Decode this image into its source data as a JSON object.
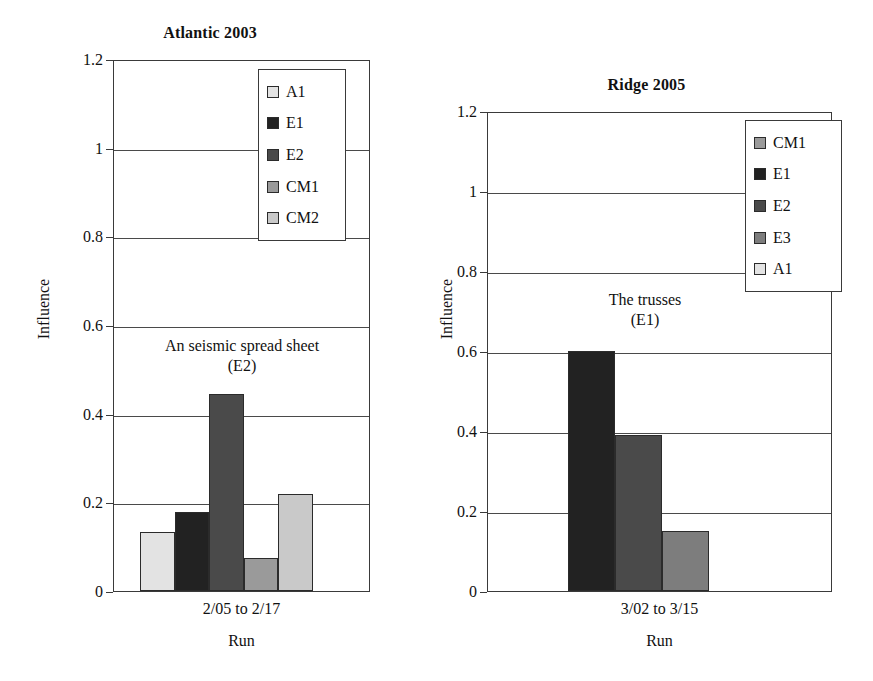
{
  "charts": [
    {
      "id": "atlantic-2003",
      "title": "Atlantic 2003",
      "ylabel": "Influence",
      "xlabel": "Run",
      "category": "2/05 to 2/17",
      "yticks": [
        "0",
        "0.2",
        "0.4",
        "0.6",
        "0.8",
        "1",
        "1.2"
      ],
      "annotation_line1": "An seismic spread sheet",
      "annotation_line2": "(E2)",
      "legend": [
        {
          "label": "A1",
          "color": "#e3e3e3"
        },
        {
          "label": "E1",
          "color": "#222222"
        },
        {
          "label": "E2",
          "color": "#4a4a4a"
        },
        {
          "label": "CM1",
          "color": "#9a9a9a"
        },
        {
          "label": "CM2",
          "color": "#c9c9c9"
        }
      ],
      "bars": [
        {
          "label": "A1",
          "value": 0.133,
          "color": "#e3e3e3"
        },
        {
          "label": "E1",
          "value": 0.178,
          "color": "#222222"
        },
        {
          "label": "E2",
          "value": 0.445,
          "color": "#4a4a4a"
        },
        {
          "label": "CM1",
          "value": 0.075,
          "color": "#9a9a9a"
        },
        {
          "label": "CM2",
          "value": 0.218,
          "color": "#c9c9c9"
        }
      ]
    },
    {
      "id": "ridge-2005",
      "title": "Ridge 2005",
      "ylabel": "Influence",
      "xlabel": "Run",
      "category": "3/02 to 3/15",
      "yticks": [
        "0",
        "0.2",
        "0.4",
        "0.6",
        "0.8",
        "1",
        "1.2"
      ],
      "annotation_line1": "The trusses",
      "annotation_line2": "(E1)",
      "legend": [
        {
          "label": "CM1",
          "color": "#9a9a9a"
        },
        {
          "label": "E1",
          "color": "#222222"
        },
        {
          "label": "E2",
          "color": "#4a4a4a"
        },
        {
          "label": "E3",
          "color": "#7d7d7d"
        },
        {
          "label": "A1",
          "color": "#e3e3e3"
        }
      ],
      "bars": [
        {
          "label": "E1",
          "value": 0.6,
          "color": "#222222"
        },
        {
          "label": "E2",
          "value": 0.39,
          "color": "#4a4a4a"
        },
        {
          "label": "E3",
          "value": 0.15,
          "color": "#7d7d7d"
        }
      ]
    }
  ],
  "chart_data": [
    {
      "type": "bar",
      "title": "Atlantic 2003",
      "xlabel": "Run",
      "ylabel": "Influence",
      "categories": [
        "A1",
        "E1",
        "E2",
        "CM1",
        "CM2"
      ],
      "values": [
        0.133,
        0.178,
        0.445,
        0.075,
        0.218
      ],
      "group_label": "2/05 to 2/17",
      "ylim": [
        0,
        1.2
      ],
      "ytick_values": [
        0,
        0.2,
        0.4,
        0.6,
        0.8,
        1,
        1.2
      ],
      "grid": "horizontal",
      "legend_position": "top-right",
      "legend": [
        "A1",
        "E1",
        "E2",
        "CM1",
        "CM2"
      ],
      "annotations": [
        "An seismic spread sheet",
        "(E2)"
      ]
    },
    {
      "type": "bar",
      "title": "Ridge 2005",
      "xlabel": "Run",
      "ylabel": "Influence",
      "categories": [
        "E1",
        "E2",
        "E3"
      ],
      "values": [
        0.6,
        0.39,
        0.15
      ],
      "group_label": "3/02 to 3/15",
      "ylim": [
        0,
        1.2
      ],
      "ytick_values": [
        0,
        0.2,
        0.4,
        0.6,
        0.8,
        1,
        1.2
      ],
      "grid": "horizontal",
      "legend_position": "top-right",
      "legend": [
        "CM1",
        "E1",
        "E2",
        "E3",
        "A1"
      ],
      "annotations": [
        "The trusses",
        "(E1)"
      ]
    }
  ]
}
